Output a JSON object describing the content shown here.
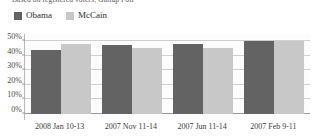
{
  "figure": {
    "source_note": "Based on registered voters; Gallup Poll"
  },
  "legend": {
    "position": "top-left",
    "items": [
      {
        "label": "Obama",
        "color": "#636363",
        "swatch": "legend-swatch-obama"
      },
      {
        "label": "McCain",
        "color": "#c8c8c8",
        "swatch": "legend-swatch-mccain"
      }
    ]
  },
  "axes": {
    "yticks": [
      "0%",
      "10%",
      "20%",
      "30%",
      "40%",
      "50%"
    ],
    "ylim": [
      0,
      50
    ],
    "grid": true
  },
  "chart_data": {
    "type": "bar",
    "title": "",
    "subtitle": "Based on registered voters; Gallup Poll",
    "xlabel": "",
    "ylabel": "",
    "ylim": [
      0,
      50
    ],
    "grid": true,
    "legend_position": "top-left",
    "categories": [
      "2008 Jan 10-13",
      "2007 Nov 11-14",
      "2007 Jun 11-14",
      "2007 Feb 9-11"
    ],
    "series": [
      {
        "name": "Obama",
        "color": "#636363",
        "values": [
          44,
          47,
          48,
          50
        ]
      },
      {
        "name": "McCain",
        "color": "#c8c8c8",
        "values": [
          48,
          45,
          45,
          50
        ]
      }
    ]
  }
}
